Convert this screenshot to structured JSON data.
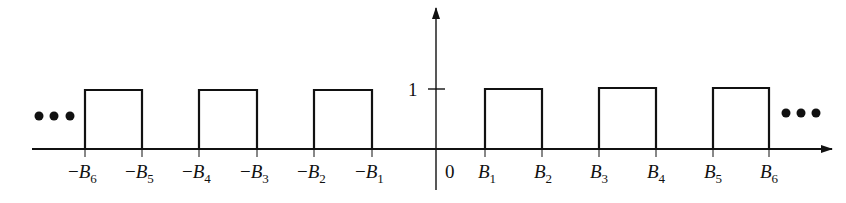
{
  "diagram": {
    "type": "periodic-pulse-spectrum",
    "y_tick_label": "1",
    "origin_label": "0",
    "left_ellipsis": "•••",
    "right_ellipsis": "•••",
    "negative_labels": [
      {
        "sign": "−",
        "var": "B",
        "sub": "6"
      },
      {
        "sign": "−",
        "var": "B",
        "sub": "5"
      },
      {
        "sign": "−",
        "var": "B",
        "sub": "4"
      },
      {
        "sign": "−",
        "var": "B",
        "sub": "3"
      },
      {
        "sign": "−",
        "var": "B",
        "sub": "2"
      },
      {
        "sign": "−",
        "var": "B",
        "sub": "1"
      }
    ],
    "positive_labels": [
      {
        "var": "B",
        "sub": "1"
      },
      {
        "var": "B",
        "sub": "2"
      },
      {
        "var": "B",
        "sub": "3"
      },
      {
        "var": "B",
        "sub": "4"
      },
      {
        "var": "B",
        "sub": "5"
      },
      {
        "var": "B",
        "sub": "6"
      }
    ],
    "pulses": [
      {
        "from": "-B6",
        "to": "-B5",
        "height": 1
      },
      {
        "from": "-B4",
        "to": "-B3",
        "height": 1
      },
      {
        "from": "-B2",
        "to": "-B1",
        "height": 1
      },
      {
        "from": "B1",
        "to": "B2",
        "height": 1
      },
      {
        "from": "B3",
        "to": "B4",
        "height": 1
      },
      {
        "from": "B5",
        "to": "B6",
        "height": 1
      }
    ],
    "stroke_color": "#111111"
  }
}
